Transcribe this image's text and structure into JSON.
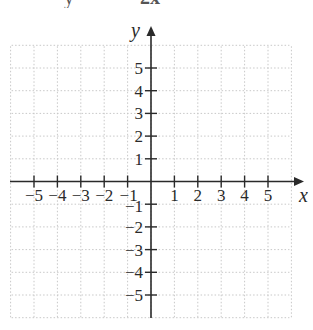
{
  "top_caption": {
    "left_text": "y",
    "right_text": "2x"
  },
  "chart_data": {
    "type": "scatter",
    "title": "",
    "xlabel": "x",
    "ylabel": "y",
    "x_ticks": [
      -5,
      -4,
      -3,
      -2,
      -1,
      1,
      2,
      3,
      4,
      5
    ],
    "y_ticks": [
      -5,
      -4,
      -3,
      -2,
      -1,
      1,
      2,
      3,
      4,
      5
    ],
    "x_tick_labels": [
      "−5",
      "−4",
      "−3",
      "−2",
      "−1",
      "1",
      "2",
      "3",
      "4",
      "5"
    ],
    "y_tick_labels": [
      "−5",
      "−4",
      "−3",
      "−2",
      "−1",
      "1",
      "2",
      "3",
      "4",
      "5"
    ],
    "xlim": [
      -6,
      6
    ],
    "ylim": [
      -6,
      6
    ],
    "grid": true,
    "grid_style": "dotted",
    "series": [],
    "legend": null
  },
  "colors": {
    "axis": "#2a2a2a",
    "grid": "#c8c8c8",
    "text": "#2a2a2a"
  }
}
